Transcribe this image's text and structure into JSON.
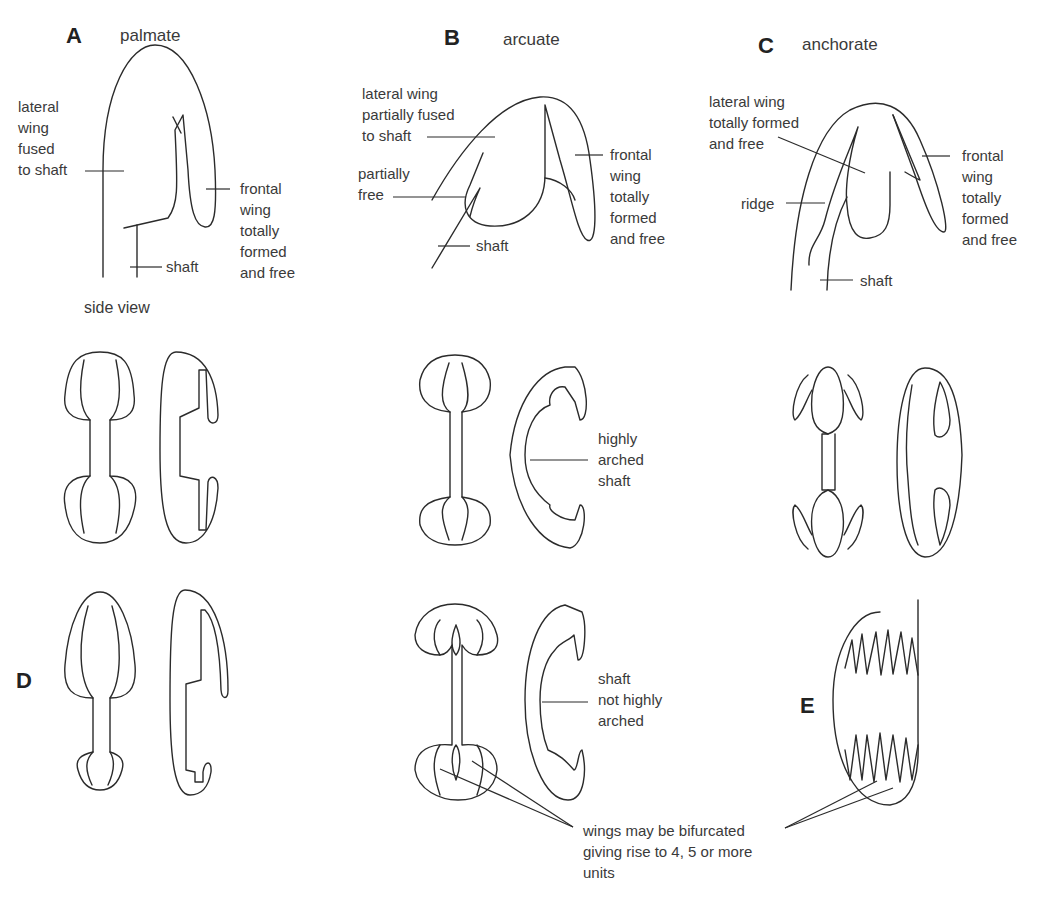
{
  "panels": {
    "A": {
      "letter": "A",
      "title": "palmate",
      "labels": {
        "lateral": "lateral\nwing\nfused\nto shaft",
        "frontal": "frontal\nwing\ntotally\nformed\nand free",
        "shaft": "shaft",
        "view": "side view"
      }
    },
    "B": {
      "letter": "B",
      "title": "arcuate",
      "labels": {
        "lateral": "lateral wing\npartially fused\nto shaft",
        "partial": "partially\nfree",
        "frontal": "frontal\nwing\ntotally\nformed\nand free",
        "shaft": "shaft",
        "arched": "highly\narched\nshaft",
        "notarched": "shaft\nnot highly\narched"
      }
    },
    "C": {
      "letter": "C",
      "title": "anchorate",
      "labels": {
        "lateral": "lateral wing\ntotally formed\nand free",
        "ridge": "ridge",
        "frontal": "frontal\nwing\ntotally\nformed\nand free",
        "shaft": "shaft"
      }
    },
    "D": {
      "letter": "D"
    },
    "E": {
      "letter": "E"
    }
  },
  "note": "wings may be bifurcated\ngiving rise to 4, 5 or more\nunits",
  "colors": {
    "line": "#2b2b2b",
    "text": "#3a3a3a",
    "background": "#ffffff"
  }
}
